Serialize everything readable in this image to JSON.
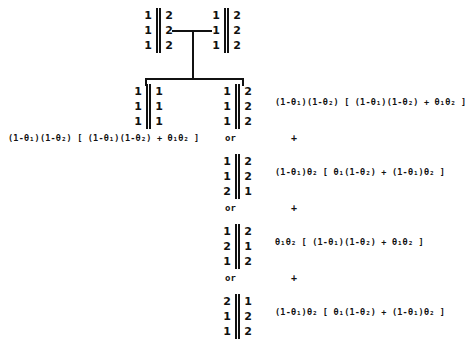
{
  "diagram": {
    "title": "Probability tree of genotype configurations",
    "theta_symbol": "θ",
    "root_pair": {
      "left_matrix": {
        "name": "root-left-matrix",
        "left_column": [
          "1",
          "1",
          "1"
        ],
        "right_column": [
          "2",
          "2",
          "2"
        ],
        "separator": "double-bar"
      },
      "right_matrix": {
        "name": "root-right-matrix",
        "left_column": [
          "1",
          "1",
          "1"
        ],
        "right_column": [
          "2",
          "2",
          "2"
        ],
        "separator": "double-bar"
      },
      "connector": "horizontal-tee"
    },
    "child_left": {
      "name": "child-left-matrix",
      "left_column": [
        "1",
        "1",
        "1"
      ],
      "right_column": [
        "1",
        "1",
        "1"
      ],
      "separator": "double-bar"
    },
    "branches": [
      {
        "id": "branch-1",
        "matrix": {
          "left_column": [
            "1",
            "1",
            "1"
          ],
          "right_column": [
            "2",
            "2",
            "2"
          ],
          "separator": "double-bar"
        },
        "formula": "(1-θ₁)(1-θ₂) [ (1-θ₁)(1-θ₂) + θ₁θ₂ ]"
      },
      {
        "id": "branch-2",
        "matrix": {
          "left_column": [
            "1",
            "1",
            "2"
          ],
          "right_column": [
            "2",
            "2",
            "1"
          ],
          "separator": "double-bar"
        },
        "formula": "(1-θ₁)θ₂ [ θ₁(1-θ₂) + (1-θ₁)θ₂ ]"
      },
      {
        "id": "branch-3",
        "matrix": {
          "left_column": [
            "1",
            "2",
            "1"
          ],
          "right_column": [
            "2",
            "1",
            "2"
          ],
          "separator": "double-bar"
        },
        "formula": "θ₁θ₂ [ (1-θ₁)(1-θ₂) + θ₁θ₂ ]"
      },
      {
        "id": "branch-4",
        "matrix": {
          "left_column": [
            "2",
            "1",
            "1"
          ],
          "right_column": [
            "1",
            "2",
            "2"
          ],
          "separator": "double-bar"
        },
        "formula": "(1-θ₁)θ₂ [ θ₁(1-θ₂) + (1-θ₁)θ₂ ]"
      }
    ],
    "left_formula": "(1-θ₁)(1-θ₂) [ (1-θ₁)(1-θ₂) + θ₁θ₂ ]",
    "separators": {
      "or_label": "or",
      "plus_label": "+",
      "or_count": 3,
      "plus_count": 3
    },
    "colors": {
      "ink": "#111111",
      "background": "#ffffff"
    }
  }
}
